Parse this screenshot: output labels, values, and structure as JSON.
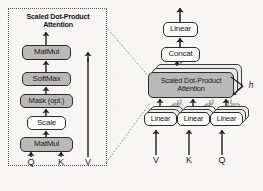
{
  "figure": {
    "type": "diagram",
    "panels": [
      {
        "id": "left",
        "title": "Scaled Dot-Product Attention",
        "title_lines": [
          "Scaled Dot-Product",
          "Attention"
        ]
      },
      {
        "id": "right",
        "title": "Multi-Head Attention"
      }
    ]
  },
  "left_panel": {
    "title_line1": "Scaled Dot-Product",
    "title_line2": "Attention",
    "nodes": [
      {
        "label": "MatMul",
        "fill": "gray",
        "name": "matmul-top"
      },
      {
        "label": "SoftMax",
        "fill": "gray",
        "name": "softmax"
      },
      {
        "label": "Mask (opt.)",
        "fill": "gray",
        "name": "mask-opt"
      },
      {
        "label": "Scale",
        "fill": "white",
        "name": "scale"
      },
      {
        "label": "MatMul",
        "fill": "gray",
        "name": "matmul-bottom"
      }
    ],
    "inputs": [
      {
        "label": "Q",
        "name": "input-q"
      },
      {
        "label": "K",
        "name": "input-k"
      },
      {
        "label": "V",
        "name": "input-v"
      }
    ]
  },
  "right_panel": {
    "nodes": [
      {
        "label": "Linear",
        "fill": "white",
        "name": "linear-output"
      },
      {
        "label": "Concat",
        "fill": "white",
        "name": "concat"
      }
    ],
    "attention_block": {
      "line1": "Scaled Dot-Product",
      "line2": "Attention",
      "fill": "gray",
      "stack_count": 3
    },
    "projection_linears": [
      {
        "label": "Linear",
        "name": "linear-v"
      },
      {
        "label": "Linear",
        "name": "linear-k"
      },
      {
        "label": "Linear",
        "name": "linear-q"
      }
    ],
    "heads_label": "h",
    "inputs": [
      {
        "label": "V",
        "name": "input-v"
      },
      {
        "label": "K",
        "name": "input-k"
      },
      {
        "label": "Q",
        "name": "input-q"
      }
    ]
  },
  "colors": {
    "background": "#f7f6f4",
    "box_gray": "#b9b9b9",
    "box_white": "#fdfdfd",
    "stroke": "#2b2b2b",
    "stack_gray": "#ededed"
  }
}
